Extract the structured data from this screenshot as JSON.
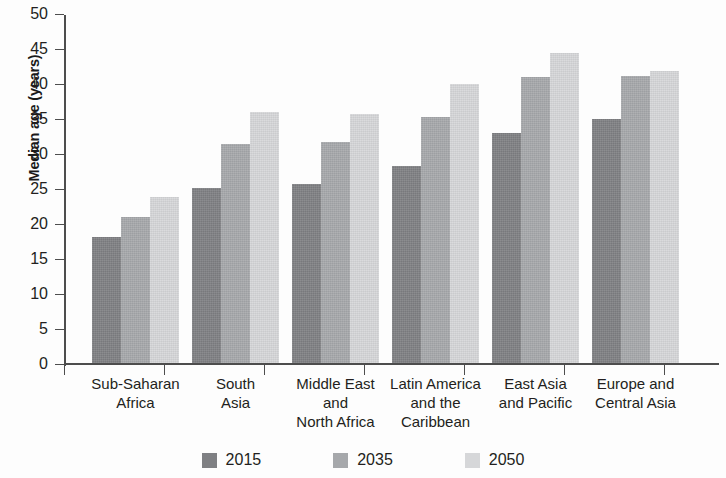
{
  "chart_data": {
    "type": "bar",
    "title": "",
    "xlabel": "",
    "ylabel": "Median age (years)",
    "ylim": [
      0,
      50
    ],
    "yticks": [
      0,
      5,
      10,
      15,
      20,
      25,
      30,
      35,
      40,
      45,
      50
    ],
    "ytick_labels": [
      "0",
      "5",
      "10",
      "15",
      "20",
      "25",
      "30",
      "35",
      "40",
      "45",
      "50"
    ],
    "grid": false,
    "legend_position": "bottom-center",
    "categories": [
      "Sub-Saharan Africa",
      "South Asia",
      "Middle East and North Africa",
      "Latin America and the Caribbean",
      "East Asia and Pacific",
      "Europe and Central Asia"
    ],
    "category_lines": [
      [
        "Sub-Saharan",
        "Africa"
      ],
      [
        "South",
        "Asia"
      ],
      [
        "Middle East",
        "and",
        "North Africa"
      ],
      [
        "Latin America",
        "and the",
        "Caribbean"
      ],
      [
        "East Asia",
        "and Pacific"
      ],
      [
        "Europe and",
        "Central Asia"
      ]
    ],
    "series": [
      {
        "name": "2015",
        "color": "#7f8083",
        "values": [
          18.1,
          25.0,
          25.6,
          28.2,
          32.9,
          34.9
        ]
      },
      {
        "name": "2035",
        "color": "#a6a8ab",
        "values": [
          20.9,
          31.3,
          31.6,
          35.2,
          40.9,
          41.0
        ]
      },
      {
        "name": "2050",
        "color": "#d6d7d9",
        "values": [
          23.8,
          35.9,
          35.6,
          39.9,
          44.4,
          41.8
        ]
      }
    ]
  },
  "legend": {
    "items": [
      {
        "label": "2015",
        "color": "#7f8083"
      },
      {
        "label": "2035",
        "color": "#a6a8ab"
      },
      {
        "label": "2050",
        "color": "#d6d7d9"
      }
    ]
  }
}
